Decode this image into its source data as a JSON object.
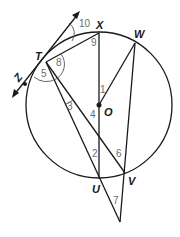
{
  "diagram": {
    "title": "",
    "circle": {
      "center_label": "O"
    },
    "points": {
      "T": "T",
      "X": "X",
      "W": "W",
      "O": "O",
      "U": "U",
      "V": "V",
      "Z": "Z"
    },
    "angles": [
      "1",
      "2",
      "3",
      "4",
      "5",
      "6",
      "7",
      "8",
      "9",
      "10"
    ],
    "colors": {
      "line": "#1a1a1a",
      "angle_number": "#6b6b6b",
      "background": "#ffffff"
    }
  }
}
